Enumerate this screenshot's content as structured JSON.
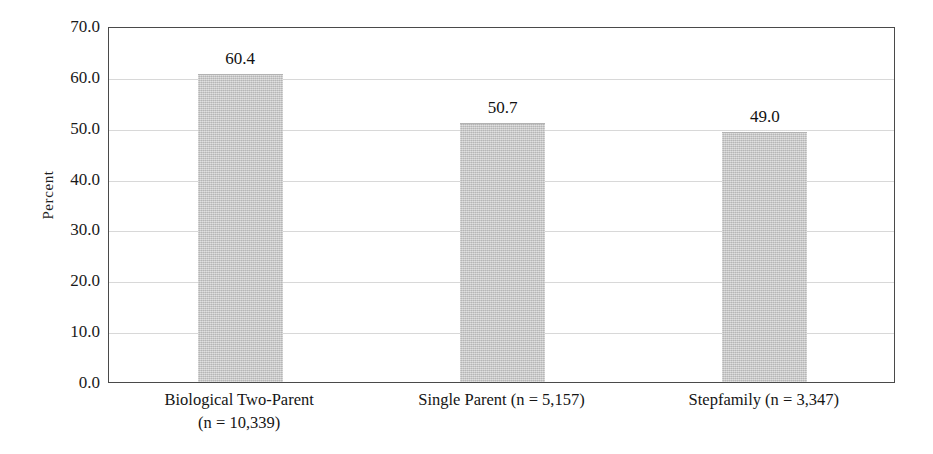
{
  "chart_data": {
    "type": "bar",
    "title": "",
    "subtitle": "",
    "xlabel": "",
    "ylabel": "Percent",
    "ylim": [
      0.0,
      70.0
    ],
    "ytick_values": [
      0.0,
      10.0,
      20.0,
      30.0,
      40.0,
      50.0,
      60.0,
      70.0
    ],
    "ytick_labels": [
      "0.0",
      "10.0",
      "20.0",
      "30.0",
      "40.0",
      "50.0",
      "60.0",
      "70.0"
    ],
    "gridline_values": [
      10.0,
      20.0,
      30.0,
      40.0,
      50.0,
      60.0
    ],
    "grid": "horizontal",
    "legend": "none",
    "categories": [
      "Biological Two-Parent (n = 10,339)",
      "Single Parent (n = 5,157)",
      "Stepfamily (n = 3,347)"
    ],
    "category_lines": [
      [
        "Biological Two-Parent",
        "(n = 10,339)"
      ],
      [
        "Single Parent (n = 5,157)"
      ],
      [
        "Stepfamily (n = 3,347)"
      ]
    ],
    "sample_sizes": [
      10339,
      5157,
      3347
    ],
    "values": [
      60.4,
      50.7,
      49.0
    ],
    "value_labels": [
      "60.4",
      "50.7",
      "49.0"
    ],
    "bar_color": "#c6c6c6",
    "axis_color": "#4a4a4a",
    "grid_color": "#d8d8d8",
    "text_color": "#1a1a1a"
  }
}
